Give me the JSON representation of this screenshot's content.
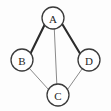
{
  "figure": {
    "kind": "undirected-graph-diagram",
    "width": 111,
    "height": 111,
    "background_color": "#fdfdfd"
  },
  "style": {
    "node_fill": "#ffffff",
    "node_stroke": "#3a3a3a",
    "node_stroke_width": 1.3,
    "node_radius": 11,
    "label_color": "#262626",
    "label_font_size": 11,
    "edge_color_strong": "#2b2b2b",
    "edge_color_light": "#8a8a8a",
    "edge_width_strong": 2.1,
    "edge_width_light": 1.0
  },
  "graph": {
    "directed": false,
    "node_count": 4,
    "edge_count": 5,
    "nodes": [
      {
        "id": "A",
        "label": "A",
        "cx": 53,
        "cy": 18,
        "r": 11
      },
      {
        "id": "B",
        "label": "B",
        "cx": 22,
        "cy": 60,
        "r": 11
      },
      {
        "id": "C",
        "label": "C",
        "cx": 58,
        "cy": 95,
        "r": 11
      },
      {
        "id": "D",
        "label": "D",
        "cx": 89,
        "cy": 60,
        "r": 11
      }
    ],
    "edges": [
      {
        "id": "A-B",
        "source": "A",
        "target": "B",
        "weight_style": "strong",
        "x1": 44.5,
        "y1": 25.0,
        "x2": 30.5,
        "y2": 53.5
      },
      {
        "id": "A-D",
        "source": "A",
        "target": "D",
        "weight_style": "strong",
        "x1": 62.5,
        "y1": 24.5,
        "x2": 80.0,
        "y2": 53.5
      },
      {
        "id": "A-C",
        "source": "A",
        "target": "C",
        "weight_style": "light",
        "x1": 54.3,
        "y1": 29.0,
        "x2": 56.8,
        "y2": 84.0
      },
      {
        "id": "B-C",
        "source": "B",
        "target": "C",
        "weight_style": "light",
        "x1": 29.5,
        "y1": 68.5,
        "x2": 48.5,
        "y2": 89.5
      },
      {
        "id": "C-D",
        "source": "C",
        "target": "D",
        "weight_style": "light",
        "x1": 67.5,
        "y1": 89.5,
        "x2": 82.0,
        "y2": 69.0
      }
    ]
  }
}
